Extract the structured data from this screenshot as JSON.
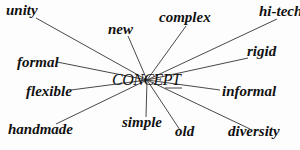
{
  "diagram": {
    "type": "word-association",
    "center": {
      "label": "CONCEPT",
      "x": 147,
      "y": 80
    },
    "line_color": "#333333",
    "nodes": [
      {
        "id": "unity",
        "label": "unity",
        "lx": 6,
        "ly": 3,
        "ax": 36,
        "ay": 18
      },
      {
        "id": "new",
        "label": "new",
        "lx": 108,
        "ly": 22,
        "ax": 128,
        "ay": 36
      },
      {
        "id": "complex",
        "label": "complex",
        "lx": 159,
        "ly": 10,
        "ax": 186,
        "ay": 26
      },
      {
        "id": "hi-tech",
        "label": "hi-tech",
        "lx": 259,
        "ly": 4,
        "ax": 277,
        "ay": 19
      },
      {
        "id": "formal",
        "label": "formal",
        "lx": 17,
        "ly": 55,
        "ax": 57,
        "ay": 62
      },
      {
        "id": "rigid",
        "label": "rigid",
        "lx": 247,
        "ly": 44,
        "ax": 248,
        "ay": 58
      },
      {
        "id": "flexible",
        "label": "flexible",
        "lx": 26,
        "ly": 84,
        "ax": 71,
        "ay": 90
      },
      {
        "id": "informal",
        "label": "informal",
        "lx": 222,
        "ly": 84,
        "ax": 220,
        "ay": 90
      },
      {
        "id": "handmade",
        "label": "handmade",
        "lx": 8,
        "ly": 122,
        "ax": 56,
        "ay": 124
      },
      {
        "id": "simple",
        "label": "simple",
        "lx": 122,
        "ly": 115,
        "ax": 146,
        "ay": 117
      },
      {
        "id": "old",
        "label": "old",
        "lx": 175,
        "ly": 124,
        "ax": 180,
        "ay": 130
      },
      {
        "id": "diversity",
        "label": "diversity",
        "lx": 228,
        "ly": 124,
        "ax": 250,
        "ay": 129
      }
    ]
  },
  "labels": {
    "center": "CONCEPT",
    "unity": "unity",
    "new": "new",
    "complex": "complex",
    "hi_tech": "hi-tech",
    "formal": "formal",
    "rigid": "rigid",
    "flexible": "flexible",
    "informal": "informal",
    "handmade": "handmade",
    "simple": "simple",
    "old": "old",
    "diversity": "diversity"
  }
}
